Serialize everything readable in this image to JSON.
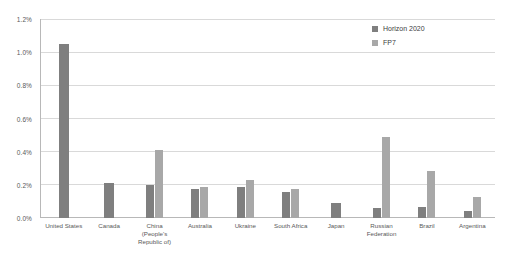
{
  "chart_data": {
    "type": "bar",
    "title": "",
    "xlabel": "",
    "ylabel": "",
    "ylim": [
      0,
      1.2
    ],
    "ytick_labels": [
      "1.2%",
      "1.0%",
      "0.8%",
      "0.6%",
      "0.4%",
      "0.2%",
      "0.0%"
    ],
    "ytick_values": [
      1.2,
      1.0,
      0.8,
      0.6,
      0.4,
      0.2,
      0.0
    ],
    "grid": true,
    "legend_position": "top-right",
    "categories": [
      "United States",
      "Canada",
      "China (People's Republic of)",
      "Australia",
      "Ukraine",
      "South Africa",
      "Japan",
      "Russian Federation",
      "Brazil",
      "Argentina"
    ],
    "series": [
      {
        "name": "Horizon 2020",
        "color": "#7f7f7f",
        "values": [
          1.05,
          0.21,
          0.2,
          0.175,
          0.19,
          0.155,
          0.09,
          0.06,
          0.065,
          0.045
        ]
      },
      {
        "name": "FP7",
        "color": "#a8a8a8",
        "values": [
          null,
          null,
          0.41,
          0.185,
          0.23,
          0.175,
          null,
          0.49,
          0.285,
          0.125
        ]
      }
    ]
  },
  "legend": {
    "items": [
      {
        "label": "Horizon 2020",
        "color": "#7f7f7f"
      },
      {
        "label": "FP7",
        "color": "#a8a8a8"
      }
    ]
  },
  "axis": {
    "y_ticks": [
      "1.2%",
      "1.0%",
      "0.8%",
      "0.6%",
      "0.4%",
      "0.2%",
      "0.0%"
    ],
    "x_categories": [
      "United States",
      "Canada",
      "China (People's Republic of)",
      "Australia",
      "Ukraine",
      "South Africa",
      "Japan",
      "Russian Federation",
      "Brazil",
      "Argentina"
    ]
  }
}
